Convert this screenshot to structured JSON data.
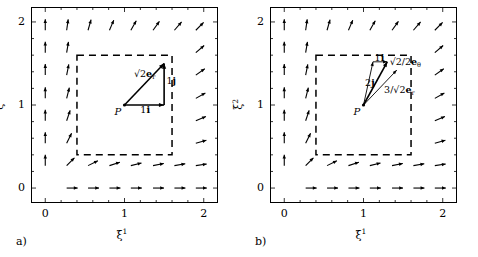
{
  "figure": {
    "axis": {
      "xlabel": "ξ",
      "xlabel_sup": "1",
      "ylabel": "ξ",
      "ylabel_sup": "2",
      "xticks": [
        "0",
        "1",
        "2"
      ],
      "yticks": [
        "0",
        "1",
        "2"
      ],
      "xlim": [
        -0.18,
        2.18
      ],
      "ylim": [
        -0.18,
        2.18
      ],
      "minor_ticks": true,
      "grid": false
    },
    "dashed_box": {
      "x0": 0.4,
      "x1": 1.6,
      "y0": 0.4,
      "y1": 1.6
    },
    "base_point": {
      "label": "P",
      "x": 1.0,
      "y": 1.0
    }
  },
  "panels": [
    {
      "caption": "a)",
      "origin_marker": "P",
      "vectors": [
        {
          "name": "resultant",
          "label_main": "√2",
          "label_bold": "e",
          "label_sub": "r",
          "from": [
            1.0,
            1.0
          ],
          "to": [
            1.5,
            1.5
          ],
          "style": "solid-arrow",
          "label_pos": [
            1.12,
            1.36
          ]
        },
        {
          "name": "horizontal-component",
          "label_main": "1",
          "label_bold": "i",
          "label_sub": "",
          "from": [
            1.0,
            1.0
          ],
          "to": [
            1.5,
            1.0
          ],
          "style": "solid-arrow",
          "label_pos": [
            1.2,
            0.93
          ]
        },
        {
          "name": "vertical-component",
          "label_main": "1",
          "label_bold": "j",
          "label_sub": "",
          "from": [
            1.5,
            1.0
          ],
          "to": [
            1.5,
            1.5
          ],
          "style": "solid-arrow",
          "label_pos": [
            1.53,
            1.28
          ]
        }
      ]
    },
    {
      "caption": "b)",
      "origin_marker": "P",
      "vectors": [
        {
          "name": "resultant",
          "label_main": "√2/2",
          "label_bold": "e",
          "label_sub": "θ",
          "from": [
            1.0,
            1.0
          ],
          "to": [
            1.3,
            1.52
          ],
          "style": "solid-arrow",
          "label_pos": [
            1.33,
            1.5
          ]
        },
        {
          "name": "radial-component",
          "label_main": "3/√2",
          "label_bold": "e",
          "label_sub": "r",
          "from": [
            1.0,
            1.0
          ],
          "to": [
            1.42,
            1.42
          ],
          "style": "thin-arrow",
          "label_pos": [
            1.26,
            1.17
          ]
        },
        {
          "name": "vertical-component",
          "label_main": "2",
          "label_bold": "j",
          "label_sub": "",
          "from": [
            1.0,
            1.0
          ],
          "to": [
            1.12,
            1.52
          ],
          "style": "thin-arrow",
          "label_pos": [
            1.02,
            1.25
          ]
        },
        {
          "name": "horizontal-component",
          "label_main": "1",
          "label_bold": "i",
          "label_sub": "",
          "from": [
            1.12,
            1.52
          ],
          "to": [
            1.3,
            1.52
          ],
          "style": "thin-arrow",
          "label_pos": [
            1.14,
            1.555
          ]
        }
      ]
    }
  ],
  "chart_data": {
    "type": "quiver",
    "title": "",
    "xlabel": "ξ¹",
    "ylabel": "ξ²",
    "xlim": [
      -0.18,
      2.18
    ],
    "ylim": [
      -0.18,
      2.18
    ],
    "grid": false,
    "legend": null,
    "sample_x": [
      0.0,
      0.27,
      0.54,
      0.81,
      1.08,
      1.36,
      1.63,
      1.9
    ],
    "sample_y": [
      0.0,
      0.27,
      0.54,
      0.81,
      1.08,
      1.36,
      1.63,
      1.9
    ],
    "vector_rule": "u = x/sqrt(x^2+y^2), v = y/sqrt(x^2+y^2)",
    "blank_region": {
      "x0": 0.4,
      "x1": 1.6,
      "y0": 0.4,
      "y1": 1.6
    },
    "annotations": [
      {
        "panel": "a)",
        "text": "√2 e_r",
        "at": [
          1.5,
          1.5
        ],
        "from": [
          1.0,
          1.0
        ]
      },
      {
        "panel": "a)",
        "text": "1 i",
        "at": [
          1.5,
          1.0
        ],
        "from": [
          1.0,
          1.0
        ]
      },
      {
        "panel": "a)",
        "text": "1 j",
        "at": [
          1.5,
          1.5
        ],
        "from": [
          1.5,
          1.0
        ]
      },
      {
        "panel": "b)",
        "text": "√2/2 e_θ",
        "at": [
          1.3,
          1.52
        ],
        "from": [
          1.0,
          1.0
        ]
      },
      {
        "panel": "b)",
        "text": "3/√2 e_r",
        "at": [
          1.42,
          1.42
        ],
        "from": [
          1.0,
          1.0
        ]
      },
      {
        "panel": "b)",
        "text": "2 j",
        "at": [
          1.12,
          1.52
        ],
        "from": [
          1.0,
          1.0
        ]
      },
      {
        "panel": "b)",
        "text": "1 i",
        "at": [
          1.3,
          1.52
        ],
        "from": [
          1.12,
          1.52
        ]
      }
    ]
  }
}
